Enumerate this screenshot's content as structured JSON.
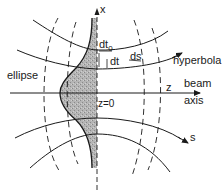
{
  "diagram": {
    "type": "beam-coordinate-diagram",
    "labels": {
      "x_axis": "x",
      "z_axis": "z",
      "beam": "beam",
      "axis": "axis",
      "waist": "z=0",
      "hyperbola": "hyperbola",
      "ellipse": "ellipse",
      "dt0": "dt",
      "dt0_sub": "0",
      "dt": "dt",
      "ds": "ds",
      "s": "s"
    },
    "colors": {
      "line": "#1a1a1a",
      "shade": "#9a9a9a",
      "background": "#ffffff"
    }
  }
}
